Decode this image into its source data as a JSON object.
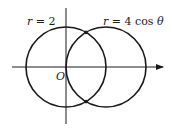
{
  "diagram": {
    "labels": {
      "circle1": "r = 2",
      "circle1_var": "r",
      "circle1_rest": " = 2",
      "circle2_var": "r",
      "circle2_rest": " = 4 cos ",
      "circle2_theta": "θ",
      "origin": "O"
    },
    "colors": {
      "stroke": "#1a1a1a",
      "background": "#ffffff"
    },
    "geometry": {
      "origin": [
        66,
        67
      ],
      "circle1": {
        "cx": 66,
        "cy": 67,
        "r": 40
      },
      "circle2": {
        "cx": 106,
        "cy": 67,
        "r": 40
      },
      "intersections": [
        [
          86,
          32.4
        ],
        [
          86,
          101.6
        ]
      ],
      "x_axis": {
        "x1": 12,
        "x2": 163
      },
      "y_axis": {
        "y1": 8,
        "y2": 124
      }
    }
  }
}
